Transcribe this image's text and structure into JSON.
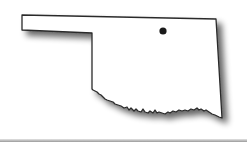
{
  "map": {
    "region": "Oklahoma",
    "type": "state-outline",
    "fill_color": "#ffffff",
    "outline_color": "#2a2a2a",
    "shadow_color": "#808080",
    "markers": [
      {
        "name": "location-marker",
        "color": "#1a1a1a"
      }
    ]
  }
}
